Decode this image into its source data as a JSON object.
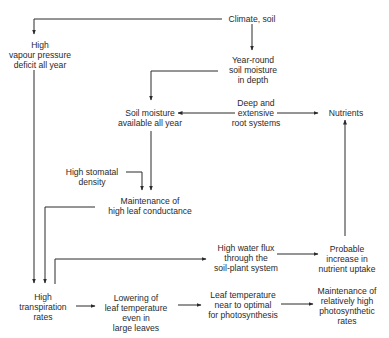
{
  "diagram": {
    "nodes": {
      "climate_soil": "Climate, soil",
      "vapour_pressure": "High\nvapour pressure\ndeficit all year",
      "year_round_moisture": "Year-round\nsoil moisture\nin depth",
      "soil_moisture": "Soil moisture\navailable all year",
      "root_systems": "Deep and\nextensive\nroot systems",
      "nutrients": "Nutrients",
      "stomatal_density": "High stomatal\ndensity",
      "leaf_conductance": "Maintenance of\nhigh leaf conductance",
      "water_flux": "High water flux\nthrough the\nsoil-plant system",
      "nutrient_uptake": "Probable\nincrease in\nnutrient uptake",
      "transpiration": "High\ntranspiration\nrates",
      "lowering_leaf_temp": "Lowering of\nleaf temperature\neven in\nlarge leaves",
      "leaf_temp_optimal": "Leaf temperature\nnear to optimal\nfor photosynthesis",
      "photosynthetic_rates": "Maintenance of\nrelatively high\nphotosynthetic\nrates"
    },
    "edges": [
      {
        "from": "Climate, soil",
        "to": "High vapour pressure deficit all year"
      },
      {
        "from": "Climate, soil",
        "to": "Year-round soil moisture in depth"
      },
      {
        "from": "Year-round soil moisture in depth",
        "to": "Soil moisture available all year"
      },
      {
        "from": "Deep and extensive root systems",
        "to": "Soil moisture available all year"
      },
      {
        "from": "Deep and extensive root systems",
        "to": "Nutrients"
      },
      {
        "from": "Soil moisture available all year",
        "to": "Maintenance of high leaf conductance"
      },
      {
        "from": "High stomatal density",
        "to": "Maintenance of high leaf conductance"
      },
      {
        "from": "High vapour pressure deficit all year",
        "to": "High transpiration rates"
      },
      {
        "from": "Maintenance of high leaf conductance",
        "to": "High transpiration rates"
      },
      {
        "from": "High transpiration rates",
        "to": "High water flux through the soil-plant system"
      },
      {
        "from": "High water flux through the soil-plant system",
        "to": "Probable increase in nutrient uptake"
      },
      {
        "from": "Probable increase in nutrient uptake",
        "to": "Nutrients"
      },
      {
        "from": "High transpiration rates",
        "to": "Lowering of leaf temperature even in large leaves"
      },
      {
        "from": "Lowering of leaf temperature even in large leaves",
        "to": "Leaf temperature near to optimal for photosynthesis"
      },
      {
        "from": "Leaf temperature near to optimal for photosynthesis",
        "to": "Maintenance of relatively high photosynthetic rates"
      }
    ]
  }
}
